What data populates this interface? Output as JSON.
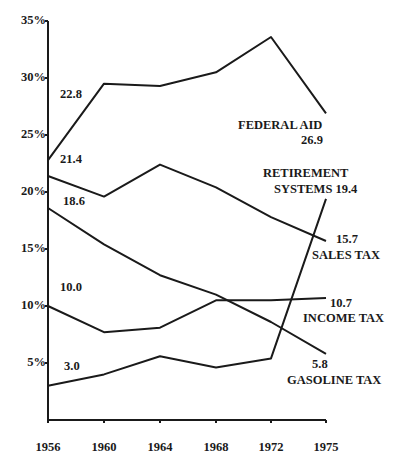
{
  "chart_data": {
    "type": "line",
    "title": "",
    "xlabel": "",
    "ylabel": "",
    "x": [
      1956,
      1960,
      1964,
      1968,
      1972,
      1975
    ],
    "ylim": [
      0,
      35
    ],
    "y_ticks": [
      "5%",
      "10%",
      "15%",
      "20%",
      "25%",
      "30%",
      "35%"
    ],
    "x_ticks": [
      "1956",
      "1960",
      "1964",
      "1968",
      "1972",
      "1975"
    ],
    "grid": false,
    "legend": "inline labels at line ends",
    "series": [
      {
        "name": "FEDERAL AID",
        "values": [
          22.8,
          29.5,
          29.3,
          30.5,
          33.6,
          26.9
        ],
        "start_label": "22.8",
        "end_label": "26.9"
      },
      {
        "name": "SALES TAX",
        "values": [
          21.4,
          19.6,
          22.4,
          20.4,
          17.8,
          15.7
        ],
        "start_label": "21.4",
        "end_label": "15.7"
      },
      {
        "name": "GASOLINE TAX",
        "values": [
          18.6,
          15.4,
          12.7,
          11.0,
          8.6,
          5.8
        ],
        "start_label": "18.6",
        "end_label": "5.8"
      },
      {
        "name": "INCOME TAX",
        "values": [
          10.0,
          7.7,
          8.1,
          10.5,
          10.5,
          10.7
        ],
        "start_label": "10.0",
        "end_label": "10.7"
      },
      {
        "name": "RETIREMENT SYSTEMS",
        "values": [
          3.0,
          4.0,
          5.6,
          4.6,
          5.4,
          19.4
        ],
        "start_label": "3.0",
        "end_label": "19.4"
      }
    ],
    "annotations": [
      {
        "text": "FEDERAL AID",
        "value": "26.9"
      },
      {
        "text": "RETIREMENT SYSTEMS",
        "value": "19.4"
      },
      {
        "text": "SALES TAX",
        "value": "15.7"
      },
      {
        "text": "INCOME TAX",
        "value": "10.7"
      },
      {
        "text": "GASOLINE TAX",
        "value": "5.8"
      }
    ]
  },
  "labels": {
    "start": {
      "federal": "22.8",
      "sales": "21.4",
      "gas": "18.6",
      "income": "10.0",
      "retire": "3.0"
    },
    "end": {
      "federal_name": "FEDERAL AID",
      "federal_val": "26.9",
      "retire_name1": "RETIREMENT",
      "retire_name2": "SYSTEMS 19.4",
      "sales_val": "15.7",
      "sales_name": "SALES TAX",
      "income_val": "10.7",
      "income_name": "INCOME TAX",
      "gas_val": "5.8",
      "gas_name": "GASOLINE TAX"
    }
  }
}
